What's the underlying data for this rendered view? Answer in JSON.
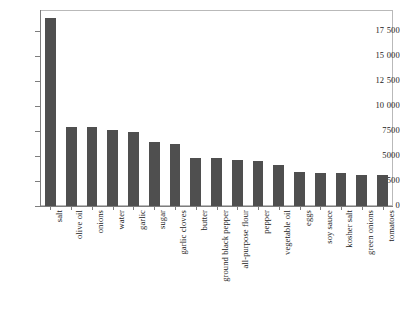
{
  "chart": {
    "type": "bar",
    "title": "",
    "xlabel": "",
    "ylabel": "",
    "bar_color": "#4f4f4f",
    "axis_color": "#7d7d7d",
    "frame_color": "#b9b9b9",
    "background": "#ffffff",
    "grid": false,
    "legend": null
  },
  "chart_data": {
    "type": "bar",
    "title": "",
    "xlabel": "",
    "ylabel": "",
    "grid": false,
    "legend_position": "none",
    "ylim": [
      0,
      19600
    ],
    "yticks": [
      0,
      2500,
      5000,
      7500,
      10000,
      12500,
      15000,
      17500
    ],
    "ytick_labels": [
      "0",
      "2500",
      "5000",
      "7500",
      "10 000",
      "12 500",
      "15 000",
      "17 500"
    ],
    "categories": [
      "salt",
      "olive oil",
      "onions",
      "water",
      "garlic",
      "sugar",
      "garlic cloves",
      "butter",
      "ground black pepper",
      "all-purpose flour",
      "pepper",
      "vegetable oil",
      "eggs",
      "soy sauce",
      "kosher salt",
      "green onions",
      "tomatoes"
    ],
    "values": [
      18800,
      7900,
      7950,
      7600,
      7400,
      6400,
      6200,
      4800,
      4800,
      4600,
      4500,
      4100,
      3450,
      3300,
      3300,
      3150,
      3100
    ]
  }
}
